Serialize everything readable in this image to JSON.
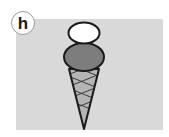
{
  "label": "h",
  "illustration": {
    "subject": "ice-cream-cone",
    "scoops": [
      {
        "name": "top-scoop",
        "color": "#ffffff"
      },
      {
        "name": "bottom-scoop",
        "color": "#7d7d7d"
      }
    ],
    "cone_color": "#b5b5b5",
    "panel_color": "#d9d9d9",
    "outline_color": "#1a1a1a"
  }
}
